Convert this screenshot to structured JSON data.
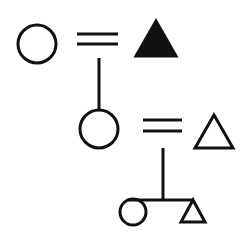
{
  "diagram": {
    "type": "kinship-chart",
    "stroke_color": "#111111",
    "background": "#ffffff",
    "generations": [
      {
        "level": 1,
        "members": [
          {
            "shape": "circle",
            "meaning": "female",
            "filled": false
          },
          {
            "shape": "triangle",
            "meaning": "male (ego/deceased)",
            "filled": true
          }
        ],
        "link": "marriage (=)"
      },
      {
        "level": 2,
        "members": [
          {
            "shape": "circle",
            "meaning": "female",
            "filled": false
          },
          {
            "shape": "triangle",
            "meaning": "male",
            "filled": false
          }
        ],
        "link": "marriage (=)"
      },
      {
        "level": 3,
        "members": [
          {
            "shape": "circle",
            "meaning": "female child",
            "filled": false
          },
          {
            "shape": "triangle",
            "meaning": "male child",
            "filled": false
          }
        ],
        "link": "sibling bar"
      }
    ]
  }
}
